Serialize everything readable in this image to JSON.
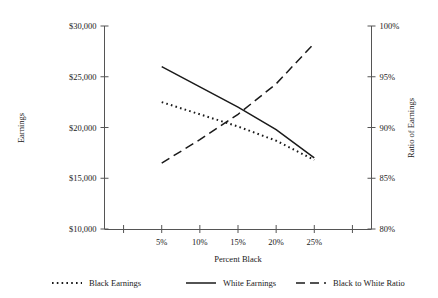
{
  "chart_data": {
    "type": "line",
    "title": "",
    "xlabel": "Percent Black",
    "ylabel": "Earnings",
    "y2label": "Ratio of Earnings",
    "categories": [
      "5%",
      "10%",
      "15%",
      "20%",
      "25%"
    ],
    "x_tick_labels": [
      "5%",
      "10%",
      "15%",
      "20%",
      "25%"
    ],
    "y_tick_labels": [
      "$10,000",
      "$15,000",
      "$20,000",
      "$25,000",
      "$30,000"
    ],
    "y_tick_values": [
      10000,
      15000,
      20000,
      25000,
      30000
    ],
    "y2_tick_labels": [
      "80%",
      "85%",
      "90%",
      "95%",
      "100%"
    ],
    "y2_tick_values": [
      80,
      85,
      90,
      95,
      100
    ],
    "ylim": [
      10000,
      30000
    ],
    "y2lim": [
      80,
      100
    ],
    "grid": false,
    "legend_position": "bottom",
    "series": [
      {
        "name": "Black Earnings",
        "axis": "left",
        "style": "dotted",
        "x": [
          "5%",
          "10%",
          "15%",
          "20%",
          "25%"
        ],
        "values": [
          22500,
          21300,
          20100,
          18700,
          16800
        ]
      },
      {
        "name": "White Earnings",
        "axis": "left",
        "style": "solid",
        "x": [
          "5%",
          "10%",
          "15%",
          "20%",
          "25%"
        ],
        "values": [
          26000,
          24000,
          22000,
          19800,
          17000
        ]
      },
      {
        "name": "Black to White Ratio",
        "axis": "right",
        "style": "dashed",
        "x": [
          "5%",
          "10%",
          "15%",
          "20%",
          "25%"
        ],
        "values": [
          86.5,
          88.8,
          91.3,
          94.3,
          98.3
        ]
      }
    ]
  },
  "legend": {
    "items": [
      {
        "label": "Black Earnings",
        "style": "dotted"
      },
      {
        "label": "White Earnings",
        "style": "solid"
      },
      {
        "label": "Black to White Ratio",
        "style": "dashed"
      }
    ]
  }
}
